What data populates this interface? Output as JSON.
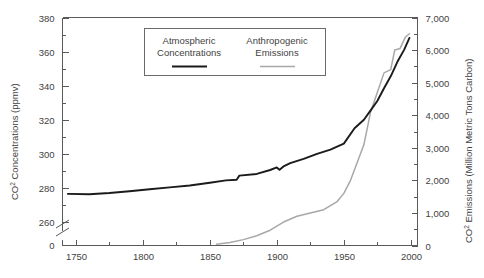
{
  "chart_data": {
    "type": "line",
    "title": "",
    "subtitle": "",
    "xlabel": "",
    "ylabel": "CO2 Concentrations (ppmv)",
    "y2label": "CO2 Emissions (Million Metric Tons Carbon)",
    "grid": false,
    "legend_position": "top-center",
    "xlim": [
      1740,
      2005
    ],
    "ylim": [
      255,
      380
    ],
    "y2lim": [
      0,
      7000
    ],
    "x_ticks": [
      1750,
      1800,
      1850,
      1900,
      1950,
      2000
    ],
    "x_tick_labels": [
      "1750",
      "1800",
      "1850",
      "1900",
      "1950",
      "2000"
    ],
    "x_minor_ticks": [
      1775,
      1825,
      1875,
      1925,
      1975
    ],
    "y_ticks": [
      260,
      280,
      300,
      320,
      340,
      360,
      380
    ],
    "y_tick_labels": [
      "260",
      "280",
      "300",
      "320",
      "340",
      "360",
      "380"
    ],
    "y_minor_ticks": [
      270,
      290,
      310,
      330,
      350,
      370
    ],
    "y_axis_break": true,
    "y_baseline_label": "0",
    "y2_ticks": [
      0,
      1000,
      2000,
      3000,
      4000,
      5000,
      6000,
      7000
    ],
    "y2_tick_labels": [
      "0",
      "1,000",
      "2,000",
      "3,000",
      "4,000",
      "5,000",
      "6,000",
      "7,000"
    ],
    "series": [
      {
        "name": "Atmospheric Concentrations",
        "axis": "left",
        "color": "#1b1b1b",
        "units": "ppmv",
        "x": [
          1744,
          1760,
          1775,
          1790,
          1805,
          1820,
          1835,
          1850,
          1862,
          1870,
          1872,
          1885,
          1895,
          1900,
          1902,
          1905,
          1910,
          1920,
          1930,
          1940,
          1950,
          1958,
          1965,
          1970,
          1975,
          1980,
          1985,
          1990,
          1995,
          1999
        ],
        "y": [
          276.5,
          276.3,
          277.0,
          278.0,
          279.2,
          280.3,
          281.4,
          283.0,
          284.4,
          284.8,
          287.2,
          288.2,
          290.5,
          292.0,
          290.6,
          292.6,
          294.5,
          297.0,
          300.0,
          302.5,
          306.0,
          315.0,
          320.0,
          325.5,
          331.0,
          338.5,
          345.5,
          354.0,
          361.0,
          368.0
        ]
      },
      {
        "name": "Anthropogenic Emissions",
        "axis": "right",
        "color": "#a8a8a8",
        "units": "Million Metric Tons Carbon",
        "x": [
          1855,
          1865,
          1875,
          1885,
          1895,
          1905,
          1915,
          1925,
          1935,
          1945,
          1950,
          1955,
          1960,
          1965,
          1970,
          1975,
          1980,
          1985,
          1988,
          1992,
          1996,
          1999
        ],
        "y": [
          40,
          90,
          180,
          300,
          470,
          720,
          900,
          1000,
          1100,
          1350,
          1600,
          2000,
          2550,
          3100,
          4100,
          4700,
          5300,
          5400,
          6000,
          6050,
          6400,
          6500
        ]
      }
    ],
    "legend": [
      {
        "label_line1": "Atmospheric",
        "label_line2": "Concentrations",
        "swatch": "thick-black-line"
      },
      {
        "label_line1": "Anthropogenic",
        "label_line2": "Emissions",
        "swatch": "thin-gray-line"
      }
    ],
    "colors": {
      "concentrations": "#1b1b1b",
      "emissions": "#a8a8a8",
      "axis": "#5a5a5a",
      "text": "#3f3f3f",
      "background": "#ffffff"
    }
  }
}
